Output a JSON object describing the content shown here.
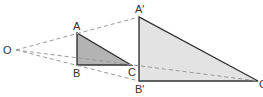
{
  "diagram": {
    "center": {
      "label": "O",
      "x": 16,
      "y": 50
    },
    "small_triangle": {
      "vertices": [
        {
          "label": "A",
          "x": 77,
          "y": 33
        },
        {
          "label": "B",
          "x": 77,
          "y": 65
        },
        {
          "label": "C",
          "x": 131,
          "y": 65
        }
      ],
      "fill": "#b3b3b3"
    },
    "large_triangle": {
      "vertices": [
        {
          "label": "A′",
          "x": 139,
          "y": 17
        },
        {
          "label": "B′",
          "x": 139,
          "y": 81
        },
        {
          "label": "C′",
          "x": 258,
          "y": 81
        }
      ],
      "fill": "#e3e3e3"
    },
    "labels": {
      "O": "O",
      "A": "A",
      "B": "B",
      "C": "C",
      "A_prime": "A′",
      "B_prime": "B′",
      "C_prime": "C′"
    },
    "colors": {
      "stroke": "#333333",
      "dashed": "#999999"
    }
  }
}
